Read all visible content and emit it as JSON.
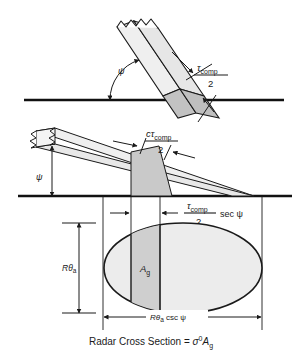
{
  "figure": {
    "caption": "Radar Cross Section = σ⁰Aᵍ",
    "caption_parts": {
      "lead": "Radar Cross Section =",
      "sigma": "σ",
      "sigma_sup": "0",
      "area": "A",
      "area_sub": "g"
    }
  },
  "colors": {
    "line": "#1a1a1a",
    "ground": "#111111",
    "fill_light": "#efefef",
    "fill_mid": "#e2e2e2",
    "fill_dark": "#c2c2c2",
    "ellipse_light": "#ececec",
    "ellipse_shaded": "#cfcfcf",
    "text": "#1a1a1a"
  },
  "panels": {
    "top": {
      "name": "steep-incidence-pulse",
      "angle_label": "ψ",
      "dimension": {
        "numerator_tau": "τ",
        "numerator_sub": "comp",
        "denominator": "2"
      }
    },
    "middle": {
      "name": "shallow-incidence-pulse",
      "angle_label": "ψ",
      "pulse_length_label": {
        "c": "c",
        "tau": "τ",
        "tau_sub": "comp",
        "denominator": "2"
      },
      "ground_projection_label": {
        "tau": "τ",
        "tau_sub": "comp",
        "denominator": "2",
        "suffix": "sec ψ"
      }
    },
    "bottom": {
      "name": "ground-footprint-ellipse",
      "vertical_dimension": {
        "R": "R",
        "theta": "θ",
        "theta_sub": "a"
      },
      "horizontal_dimension": {
        "R": "R",
        "theta": "θ",
        "theta_sub": "a",
        "suffix": "csc ψ"
      },
      "shaded_area_label": {
        "A": "A",
        "sub": "g"
      }
    }
  }
}
